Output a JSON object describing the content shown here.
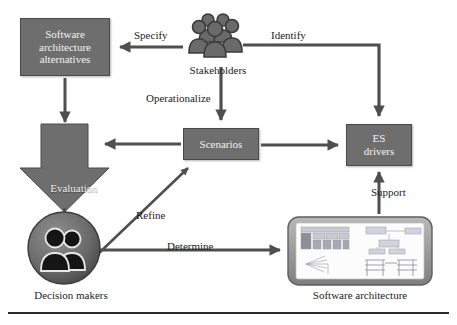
{
  "diagram": {
    "background": "#ffffff",
    "node_fill": "#6e6e6e",
    "node_stroke": "#4a4a4a",
    "node_text": "#f2f2f2",
    "arrow_color": "#4f4f4f",
    "label_color": "#1d1d1d",
    "rule_color": "#2a2a2a"
  },
  "nodes": {
    "alternatives": {
      "label": "Software architecture alternatives",
      "line1": "Software",
      "line2": "architecture",
      "line3": "alternatives",
      "shape": "rectangle"
    },
    "stakeholders": {
      "label": "Stakeholders",
      "shape": "people-icon"
    },
    "es_drivers": {
      "label": "ES drivers",
      "line1": "ES",
      "line2": "drivers",
      "shape": "rectangle"
    },
    "scenarios": {
      "label": "Scenarios",
      "shape": "rectangle"
    },
    "evaluation": {
      "label": "Evaluation",
      "shape": "down-block-arrow"
    },
    "decision_makers": {
      "label": "Decision makers",
      "shape": "circle-badge-people-icon"
    },
    "software_architecture": {
      "label": "Software architecture",
      "shape": "rounded-panel-thumbnail"
    }
  },
  "edges": [
    {
      "id": "specify",
      "label": "Specify",
      "from": "stakeholders",
      "to": "alternatives"
    },
    {
      "id": "identify",
      "label": "Identify",
      "from": "stakeholders",
      "to": "es_drivers"
    },
    {
      "id": "operationalize",
      "label": "Operationalize",
      "from": "stakeholders",
      "to": "scenarios"
    },
    {
      "id": "alternatives-to-evaluation",
      "label": "",
      "from": "alternatives",
      "to": "evaluation"
    },
    {
      "id": "scenarios-to-evaluation",
      "label": "",
      "from": "scenarios",
      "to": "evaluation"
    },
    {
      "id": "scenarios-to-esdrivers",
      "label": "",
      "from": "scenarios",
      "to": "es_drivers"
    },
    {
      "id": "evaluation-to-decisionmakers",
      "label": "",
      "from": "evaluation",
      "to": "decision_makers"
    },
    {
      "id": "refine",
      "label": "Refine",
      "from": "decision_makers",
      "to": "scenarios"
    },
    {
      "id": "determine",
      "label": "Determine",
      "from": "decision_makers",
      "to": "software_architecture"
    },
    {
      "id": "support",
      "label": "Support",
      "from": "software_architecture",
      "to": "es_drivers"
    }
  ]
}
